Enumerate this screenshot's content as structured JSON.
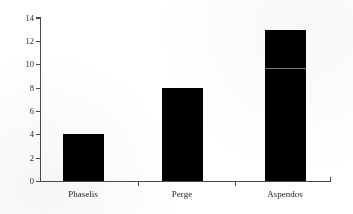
{
  "chart_data": {
    "type": "bar",
    "title": "",
    "subtitle": "",
    "xlabel": "",
    "ylabel": "",
    "categories": [
      "Phaselis",
      "Perge",
      "Aspendos"
    ],
    "values": [
      4,
      8,
      13
    ],
    "series": [
      {
        "name": "",
        "values": [
          4,
          8,
          13
        ]
      }
    ],
    "ylim": [
      0,
      14
    ],
    "ytick_labels": [
      "0",
      "2",
      "4",
      "6",
      "8",
      "10",
      "12",
      "14"
    ],
    "ytick_values": [
      0,
      2,
      4,
      6,
      8,
      10,
      12,
      14
    ],
    "grid": false,
    "legend": false,
    "legend_position": "none",
    "bar_color": "#000000",
    "axis_color": "#4a4a4a",
    "background_color": "#ffffff",
    "annotations": [
      {
        "name": "scan-artifact-line",
        "category": "Aspendos",
        "value": 9.7
      }
    ]
  },
  "axes": {
    "y_axis_name": "value-axis",
    "x_axis_name": "category-axis"
  }
}
